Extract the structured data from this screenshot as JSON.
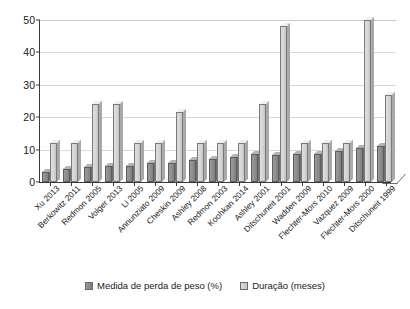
{
  "chart_data": {
    "type": "bar",
    "title": "",
    "xlabel": "",
    "ylabel": "",
    "ylim": [
      0,
      50
    ],
    "yticks": [
      0,
      10,
      20,
      30,
      40,
      50
    ],
    "grid": true,
    "legend_position": "bottom",
    "categories": [
      "Xu 2013",
      "Berkowitz 2011",
      "Redmon 2005",
      "Volger 2013",
      "Li 2005",
      "Annunziato 2009",
      "Cheskin 2009",
      "Ashley 2008",
      "Redmon 2003",
      "Koohkan 2014",
      "Ashley 2001",
      "Ditschuneit 2001",
      "Wadden 2009",
      "Flechter-Mors 2010",
      "Vazquez 2009",
      "Flechter-Mors 2000",
      "Ditschuneit 1999"
    ],
    "series": [
      {
        "name": "Medida de perda de peso (%)",
        "color": "#8d8d8d",
        "values": [
          3,
          4,
          4.5,
          5,
          5,
          6,
          5.8,
          6.7,
          7,
          7.8,
          8.5,
          8.3,
          8.6,
          8.8,
          9.6,
          10.5,
          11.2
        ]
      },
      {
        "name": "Duração (meses)",
        "color": "#d4d4d4",
        "values": [
          12,
          12,
          24,
          24,
          12,
          12,
          21.5,
          12,
          12,
          12,
          24,
          48,
          12,
          12,
          12,
          50,
          27
        ]
      }
    ]
  },
  "legend": {
    "items": [
      {
        "label": "Medida de perda de peso (%)",
        "swatch": "dark"
      },
      {
        "label": "Duração (meses)",
        "swatch": "light"
      }
    ]
  }
}
